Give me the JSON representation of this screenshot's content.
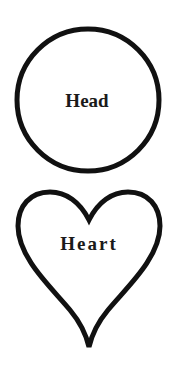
{
  "diagram": {
    "shapes": [
      {
        "type": "circle",
        "label": "Head"
      },
      {
        "type": "heart",
        "label": "Heart"
      }
    ],
    "colors": {
      "stroke": "#111111",
      "text": "#1a1a1a",
      "background": "#ffffff"
    }
  }
}
